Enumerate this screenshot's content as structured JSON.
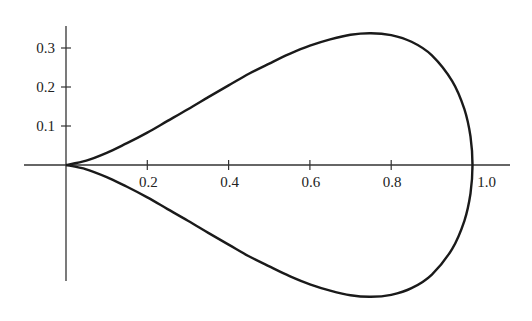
{
  "chart_data": {
    "type": "line",
    "title": "",
    "xlabel": "",
    "ylabel": "",
    "xlim": [
      0,
      1.08
    ],
    "ylim": [
      -0.34,
      0.36
    ],
    "grid": false,
    "legend": null,
    "x_ticks": [
      0.2,
      0.4,
      0.6,
      0.8,
      1.0
    ],
    "x_tick_labels": [
      "0.2",
      "0.4",
      "0.6",
      "0.8",
      "1.0"
    ],
    "y_ticks": [
      0.1,
      0.2,
      0.3
    ],
    "y_tick_labels": [
      "0.1",
      "0.2",
      "0.3"
    ],
    "series": [
      {
        "name": "upper branch",
        "x": [
          0,
          0.05,
          0.1,
          0.15,
          0.2,
          0.25,
          0.3,
          0.35,
          0.4,
          0.45,
          0.5,
          0.55,
          0.6,
          0.65,
          0.7,
          0.75,
          0.8,
          0.85,
          0.9,
          0.95,
          0.98,
          0.995,
          1.0
        ],
        "y": [
          0,
          0.011,
          0.031,
          0.056,
          0.083,
          0.113,
          0.143,
          0.174,
          0.204,
          0.234,
          0.26,
          0.285,
          0.306,
          0.322,
          0.334,
          0.338,
          0.333,
          0.316,
          0.281,
          0.215,
          0.143,
          0.073,
          0
        ]
      },
      {
        "name": "lower branch",
        "x": [
          0,
          0.05,
          0.1,
          0.15,
          0.2,
          0.25,
          0.3,
          0.35,
          0.4,
          0.45,
          0.5,
          0.55,
          0.6,
          0.65,
          0.7,
          0.75,
          0.8,
          0.85,
          0.9,
          0.95,
          0.98,
          0.995,
          1.0
        ],
        "y": [
          0,
          -0.011,
          -0.031,
          -0.056,
          -0.083,
          -0.113,
          -0.143,
          -0.174,
          -0.204,
          -0.234,
          -0.26,
          -0.285,
          -0.306,
          -0.322,
          -0.334,
          -0.338,
          -0.333,
          -0.316,
          -0.281,
          -0.215,
          -0.143,
          -0.073,
          0
        ]
      }
    ]
  },
  "colors": {
    "curve": "#1a1a1a",
    "axis": "#333333",
    "text": "#222222"
  }
}
